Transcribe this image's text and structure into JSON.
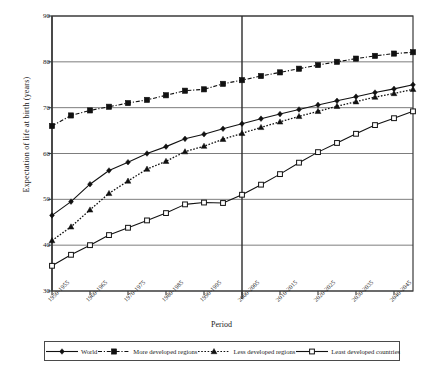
{
  "chart_data": {
    "type": "line",
    "title": "",
    "xlabel": "Period",
    "ylabel": "Expectation of life at birth (years)",
    "ylim": [
      30,
      90
    ],
    "yticks": [
      30,
      40,
      50,
      60,
      70,
      80,
      90
    ],
    "grid": true,
    "legend_position": "bottom",
    "categories": [
      "1950-1955",
      "1955-1960",
      "1960-1965",
      "1965-1970",
      "1970-1975",
      "1975-1980",
      "1980-1985",
      "1985-1990",
      "1990-1995",
      "1995-2000",
      "2000-2005",
      "2005-2010",
      "2010-2015",
      "2015-2020",
      "2020-2025",
      "2025-2030",
      "2030-2035",
      "2035-2040",
      "2040-2045",
      "2045-2050"
    ],
    "tick_labels": [
      "1950-1955",
      "1960-1965",
      "1970-1975",
      "1980-1985",
      "1990-1995",
      "2000-2005",
      "2010-2015",
      "2020-2025",
      "2030-2035",
      "2040-2045"
    ],
    "tick_label_indices": [
      0,
      2,
      4,
      6,
      8,
      10,
      12,
      14,
      16,
      18
    ],
    "divider_x_category": "2000-2005",
    "series": [
      {
        "name": "World",
        "marker": "diamond",
        "line": "solid",
        "values": [
          46.5,
          49.5,
          53.3,
          56.3,
          58.1,
          60.0,
          61.5,
          63.2,
          64.2,
          65.4,
          66.5,
          67.6,
          68.6,
          69.6,
          70.6,
          71.5,
          72.4,
          73.3,
          74.1,
          75.0
        ]
      },
      {
        "name": "More developed regions",
        "marker": "square-filled",
        "line": "dash-dot",
        "values": [
          66.0,
          68.3,
          69.4,
          70.2,
          71.0,
          71.7,
          72.7,
          73.7,
          74.0,
          75.2,
          76.0,
          76.9,
          77.7,
          78.5,
          79.3,
          80.0,
          80.7,
          81.3,
          81.8,
          82.1
        ]
      },
      {
        "name": "Less developed regions",
        "marker": "triangle",
        "line": "dotted",
        "values": [
          41.0,
          44.0,
          47.7,
          51.3,
          54.0,
          56.6,
          58.3,
          60.4,
          61.6,
          63.1,
          64.4,
          65.7,
          66.9,
          68.1,
          69.2,
          70.3,
          71.3,
          72.3,
          73.1,
          74.0
        ]
      },
      {
        "name": "Least developed countries",
        "marker": "square-open",
        "line": "solid",
        "values": [
          35.5,
          37.9,
          40.0,
          42.2,
          43.8,
          45.4,
          47.0,
          48.9,
          49.3,
          49.2,
          51.0,
          53.2,
          55.5,
          58.0,
          60.3,
          62.3,
          64.3,
          66.2,
          67.7,
          69.2
        ]
      }
    ]
  },
  "legend": {
    "items": [
      {
        "label": "World"
      },
      {
        "label": "More developed regions"
      },
      {
        "label": "Less developed regions"
      },
      {
        "label": "Least developed countries"
      }
    ]
  },
  "colors": {
    "axis": "#3a3a3a",
    "grid": "#6e6e6e",
    "series": "#111111",
    "background": "#ffffff"
  }
}
